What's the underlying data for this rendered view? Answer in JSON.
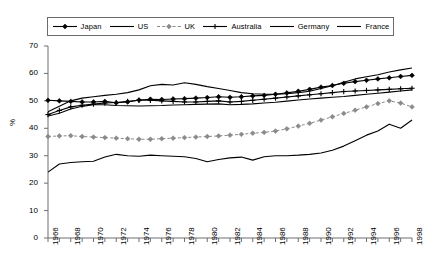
{
  "chart_data": {
    "type": "line",
    "title": "",
    "xlabel": "",
    "ylabel": "%",
    "ylim": [
      0,
      70
    ],
    "ytick_step": 10,
    "yticks": [
      0,
      10,
      20,
      30,
      40,
      50,
      60,
      70
    ],
    "xlim": [
      1966,
      1998
    ],
    "xticks_minor_every": 1,
    "xtick_labels": [
      "1966",
      "1968",
      "1970",
      "1972",
      "1974",
      "1976",
      "1978",
      "1980",
      "1982",
      "1984",
      "1986",
      "1988",
      "1990",
      "1992",
      "1994",
      "1996",
      "1998"
    ],
    "grid": false,
    "legend_position": "top",
    "x": [
      1966,
      1967,
      1968,
      1969,
      1970,
      1971,
      1972,
      1973,
      1974,
      1975,
      1976,
      1977,
      1978,
      1979,
      1980,
      1981,
      1982,
      1983,
      1984,
      1985,
      1986,
      1987,
      1988,
      1989,
      1990,
      1991,
      1992,
      1993,
      1994,
      1995,
      1996,
      1997,
      1998
    ],
    "series": [
      {
        "name": "Japan",
        "color": "#000000",
        "style": "solid-marker",
        "marker": "diamond",
        "values": [
          50.2,
          50.0,
          49.8,
          49.6,
          49.6,
          49.8,
          49.3,
          49.6,
          50.3,
          50.6,
          50.5,
          50.7,
          50.8,
          51.0,
          51.2,
          51.5,
          51.3,
          51.5,
          51.8,
          52.0,
          52.4,
          52.9,
          53.5,
          54.2,
          55.0,
          55.6,
          56.4,
          57.0,
          57.5,
          58.0,
          58.4,
          58.9,
          59.3
        ]
      },
      {
        "name": "US",
        "color": "#000000",
        "style": "solid",
        "marker": "none",
        "values": [
          44.5,
          45.5,
          47.0,
          48.0,
          48.6,
          48.6,
          48.3,
          48.2,
          48.1,
          48.2,
          48.3,
          48.5,
          48.6,
          48.7,
          48.8,
          48.9,
          48.6,
          48.7,
          48.9,
          49.2,
          49.5,
          49.9,
          50.3,
          50.7,
          51.0,
          51.3,
          51.6,
          52.0,
          52.4,
          52.8,
          53.2,
          53.6,
          54.0
        ]
      },
      {
        "name": "UK",
        "color": "#8a8a8a",
        "style": "dashed-marker",
        "marker": "diamond",
        "values": [
          37.0,
          37.2,
          37.3,
          37.0,
          36.8,
          36.6,
          36.4,
          36.2,
          36.0,
          36.0,
          36.2,
          36.4,
          36.6,
          36.8,
          37.0,
          37.2,
          37.5,
          37.8,
          38.2,
          38.5,
          39.0,
          39.8,
          40.8,
          41.8,
          43.0,
          44.2,
          45.4,
          46.6,
          47.8,
          49.0,
          50.0,
          49.2,
          47.8
        ]
      },
      {
        "name": "Australia",
        "color": "#000000",
        "style": "solid-marker",
        "marker": "plus",
        "values": [
          45.0,
          46.5,
          47.8,
          48.4,
          48.8,
          49.2,
          49.4,
          49.8,
          50.2,
          50.2,
          50.0,
          49.8,
          49.6,
          49.6,
          49.8,
          50.0,
          49.6,
          49.8,
          50.2,
          50.6,
          51.0,
          51.4,
          51.8,
          52.2,
          52.6,
          53.0,
          53.4,
          53.6,
          53.8,
          54.0,
          54.2,
          54.4,
          54.6
        ]
      },
      {
        "name": "Germany",
        "color": "#000000",
        "style": "solid",
        "marker": "none",
        "values": [
          46.0,
          48.0,
          50.0,
          51.0,
          51.5,
          52.0,
          52.4,
          53.0,
          54.0,
          55.5,
          56.0,
          55.8,
          56.6,
          56.0,
          55.2,
          54.5,
          53.8,
          53.0,
          52.6,
          52.4,
          52.4,
          52.6,
          53.0,
          53.5,
          54.5,
          55.5,
          56.8,
          58.0,
          58.8,
          59.5,
          60.5,
          61.3,
          62.0
        ]
      },
      {
        "name": "France",
        "color": "#000000",
        "style": "solid",
        "marker": "none",
        "values": [
          24.0,
          27.0,
          27.5,
          27.8,
          28.0,
          29.5,
          30.5,
          30.0,
          29.8,
          30.2,
          30.0,
          29.8,
          29.6,
          29.0,
          27.8,
          28.6,
          29.2,
          29.5,
          28.4,
          29.6,
          30.0,
          30.0,
          30.2,
          30.5,
          31.0,
          32.0,
          33.5,
          35.5,
          37.5,
          39.0,
          41.5,
          40.0,
          43.0
        ]
      }
    ]
  },
  "axis": {
    "y_title": "%"
  }
}
